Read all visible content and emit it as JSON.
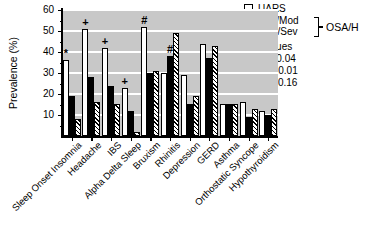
{
  "chart_data": {
    "type": "bar",
    "title": "",
    "xlabel": "",
    "ylabel": "Prevalence (%)",
    "ylim": [
      0,
      60
    ],
    "yticks": [
      10,
      20,
      30,
      40,
      50,
      60
    ],
    "grid": true,
    "plot_bg_color": "#c8c8c8",
    "categories": [
      "Sleep Onset Insomnia",
      "Headache",
      "IBS",
      "Alpha Delta Sleep",
      "Bruxism",
      "Rhinitis",
      "Depression",
      "GERD",
      "Asthma",
      "Orthostatic Syncope",
      "Hypothyroidism"
    ],
    "series": [
      {
        "name": "UARS",
        "style": "white",
        "values": [
          36,
          51,
          42,
          23,
          52,
          30,
          29,
          44,
          15,
          16,
          12
        ]
      },
      {
        "name": "Mild/Mod",
        "style": "black",
        "values": [
          19,
          28,
          24,
          12,
          30,
          38,
          15,
          37,
          15,
          9,
          10
        ]
      },
      {
        "name": "Mod/Sev",
        "style": "hatched",
        "values": [
          8,
          16,
          15,
          2,
          31,
          49,
          19,
          43,
          15,
          13,
          13
        ]
      }
    ],
    "annotations": [
      {
        "symbol": "*",
        "category_index": 0,
        "series_index": 0
      },
      {
        "symbol": "+",
        "category_index": 1,
        "series_index": 0
      },
      {
        "symbol": "+",
        "category_index": 2,
        "series_index": 0
      },
      {
        "symbol": "+",
        "category_index": 3,
        "series_index": 0
      },
      {
        "symbol": "#",
        "category_index": 4,
        "series_index": 0
      },
      {
        "symbol": "#",
        "category_index": 5,
        "series_index": 1
      }
    ],
    "legend": {
      "items": [
        "UARS",
        "Mild/Mod",
        "Mod/Sev"
      ],
      "bracket_label": "OSA/H",
      "position": "top-right",
      "p_values_title": "p values",
      "p_values": [
        "* = 0.04",
        "+ = 0.01",
        "# = 0.16"
      ]
    }
  },
  "colors": {
    "plot_bg": "#c8c8c8",
    "grid": "#ffffff",
    "bar_white": "#ffffff",
    "bar_black": "#000000",
    "text": "#000000"
  }
}
